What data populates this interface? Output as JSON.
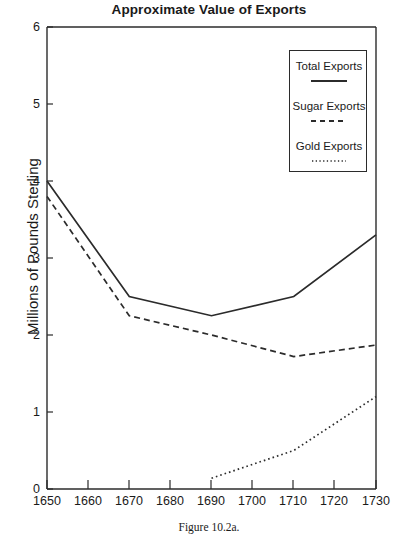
{
  "chart_data": {
    "type": "line",
    "title": "Approximate Value of Exports",
    "xlabel": "",
    "ylabel": "Millions of Pounds Sterling",
    "xlim": [
      1650,
      1730
    ],
    "ylim": [
      0,
      6
    ],
    "grid": false,
    "legend_position": "top-right",
    "x_ticks": [
      "1650",
      "1660",
      "1670",
      "1680",
      "1690",
      "1700",
      "1710",
      "1720",
      "1730"
    ],
    "y_ticks": [
      "0",
      "1",
      "2",
      "3",
      "4",
      "5",
      "6"
    ],
    "series": [
      {
        "name": "Total Exports",
        "style": "solid",
        "color": "#2b2b2b",
        "x": [
          1650,
          1670,
          1690,
          1710,
          1730
        ],
        "values": [
          4.0,
          2.5,
          2.25,
          2.5,
          3.3
        ]
      },
      {
        "name": "Sugar Exports",
        "style": "dashed",
        "color": "#2b2b2b",
        "x": [
          1650,
          1670,
          1690,
          1710,
          1730
        ],
        "values": [
          3.8,
          2.25,
          2.0,
          1.72,
          1.87
        ]
      },
      {
        "name": "Gold Exports",
        "style": "dotted",
        "color": "#2b2b2b",
        "x": [
          1690,
          1710,
          1730
        ],
        "values": [
          0.14,
          0.5,
          1.2
        ]
      }
    ]
  },
  "legend": {
    "items": [
      {
        "label": "Total Exports",
        "style": "solid"
      },
      {
        "label": "Sugar Exports",
        "style": "dashed"
      },
      {
        "label": "Gold Exports",
        "style": "dotted"
      }
    ]
  },
  "caption": "Figure 10.2a.",
  "colors": {
    "line": "#2b2b2b",
    "axis": "#2b2b2b",
    "background": "#ffffff"
  }
}
